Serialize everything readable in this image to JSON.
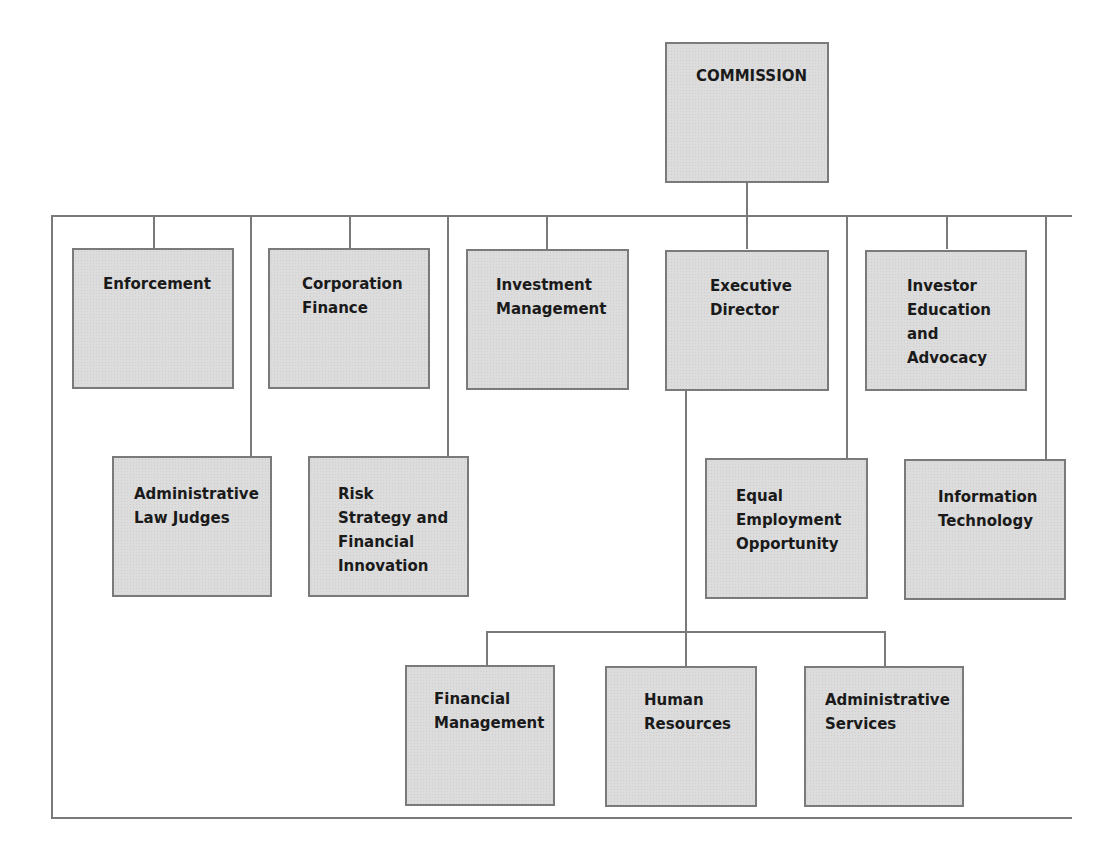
{
  "chart": {
    "title": "COMMISSION",
    "colors": {
      "box_fill": "#dcdcdc",
      "line": "#7a7a7a",
      "text": "#1a1a1a"
    },
    "top": {
      "label": "COMMISSION"
    },
    "row1": [
      {
        "label": "Enforcement"
      },
      {
        "label": "Corporation\nFinance"
      },
      {
        "label": "Investment\nManagement"
      },
      {
        "label": "Executive\nDirector"
      },
      {
        "label": "Investor\nEducation\nand\nAdvocacy"
      }
    ],
    "row2": [
      {
        "label": "Administrative\nLaw Judges"
      },
      {
        "label": "Risk\nStrategy and\nFinancial\nInnovation"
      },
      {
        "label": "Equal\nEmployment\nOpportunity"
      },
      {
        "label": "Information\nTechnology"
      }
    ],
    "row3": [
      {
        "label": "Financial\nManagement"
      },
      {
        "label": "Human\nResources"
      },
      {
        "label": "Administrative\nServices"
      }
    ]
  }
}
